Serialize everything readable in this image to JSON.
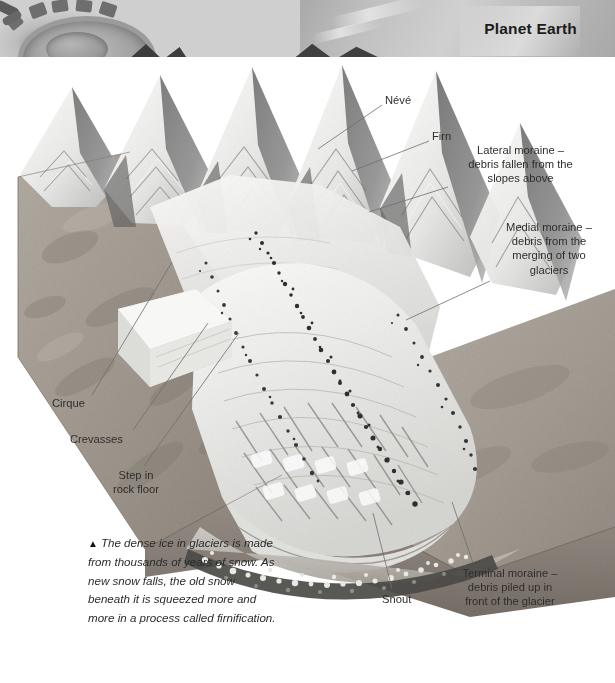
{
  "page": {
    "title": "Planet Earth",
    "background_color": "#ffffff",
    "text_color": "#2e2e2e",
    "width": 615,
    "height": 683
  },
  "header": {
    "title": "Planet Earth",
    "band_height_px": 57,
    "photo_description": "grayscale close-up photograph of machinery gear and ice",
    "photo_icon": "gear-photo"
  },
  "illustration": {
    "name": "glacier-block-diagram",
    "description": "Cutaway block diagram of a valley glacier showing snowfield, ice flow, moraines and snout",
    "style": "grayscale airbrush illustration"
  },
  "labels": [
    {
      "id": "neve",
      "text": "Névé",
      "align": "left",
      "x": 385,
      "y": 93,
      "leader": {
        "x1": 382,
        "y1": 105,
        "x2": 318,
        "y2": 149
      }
    },
    {
      "id": "firn",
      "text": "Firn",
      "align": "left",
      "x": 432,
      "y": 129,
      "leader": {
        "x1": 429,
        "y1": 141,
        "x2": 352,
        "y2": 171
      }
    },
    {
      "id": "lateral-moraine",
      "text": "Lateral moraine –\ndebris fallen from the\nslopes above",
      "align": "center",
      "x": 453,
      "y": 143,
      "w": 135,
      "leader": {
        "x1": 448,
        "y1": 187,
        "x2": 369,
        "y2": 212
      }
    },
    {
      "id": "medial-moraine",
      "text": "Medial moraine –\ndebris from the\nmerging of two\nglaciers",
      "align": "center",
      "x": 488,
      "y": 220,
      "w": 122,
      "leader": {
        "x1": 490,
        "y1": 281,
        "x2": 406,
        "y2": 320
      }
    },
    {
      "id": "cirque",
      "text": "Cirque",
      "align": "left",
      "x": 52,
      "y": 396,
      "leader": {
        "x1": 92,
        "y1": 395,
        "x2": 172,
        "y2": 262
      }
    },
    {
      "id": "crevasses",
      "text": "Crevasses",
      "align": "left",
      "x": 70,
      "y": 432,
      "leader": {
        "x1": 133,
        "y1": 430,
        "x2": 208,
        "y2": 323
      }
    },
    {
      "id": "step-in-rock-floor",
      "text": "Step in\nrock floor",
      "align": "center",
      "x": 95,
      "y": 468,
      "w": 82,
      "leader": {
        "x1": 144,
        "y1": 466,
        "x2": 239,
        "y2": 333
      }
    },
    {
      "id": "snout",
      "text": "Snout",
      "align": "left",
      "x": 382,
      "y": 592,
      "leader": {
        "x1": 392,
        "y1": 589,
        "x2": 373,
        "y2": 513
      }
    },
    {
      "id": "terminal-moraine",
      "text": "Terminal moraine –\ndebris piled up in\nfront of the glacier",
      "align": "center",
      "x": 443,
      "y": 566,
      "w": 134,
      "leader": {
        "x1": 473,
        "y1": 563,
        "x2": 452,
        "y2": 502
      }
    }
  ],
  "caption": {
    "marker": "▲",
    "text": "The dense ice in glaciers is made from thousands of years of snow. As new snow falls, the old snow beneath it is squeezed more and more in a process called firnification."
  },
  "colors": {
    "page_background": "#ffffff",
    "title_text": "#1c1c1c",
    "label_text": "#2e2e2e",
    "leader_line": "#6e6e6e",
    "rock_face": "#a59d94",
    "ice_light": "#f2f2f0",
    "ice_shadow": "#6f6f6f",
    "moraine_debris": "#3a3a3a"
  }
}
